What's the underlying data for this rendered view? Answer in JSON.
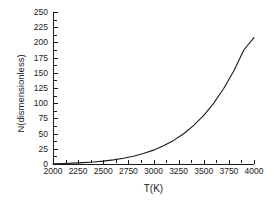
{
  "chart_data": {
    "type": "line",
    "title": "",
    "xlabel": "T(K)",
    "ylabel": "N(dismensionless)",
    "xlim": [
      2000,
      4000
    ],
    "ylim": [
      0,
      250
    ],
    "grid": false,
    "legend": "none",
    "xticks": [
      2000,
      2250,
      2500,
      2750,
      3000,
      3250,
      3500,
      3750,
      4000
    ],
    "xtick_labels": [
      "2000",
      "2250",
      "2500",
      "2750",
      "3000",
      "3250",
      "3500",
      "3750",
      "4000"
    ],
    "yticks": [
      0,
      25,
      50,
      75,
      100,
      125,
      150,
      175,
      200,
      225,
      250
    ],
    "ytick_labels": [
      "0",
      "25",
      "50",
      "75",
      "100",
      "125",
      "150",
      "175",
      "200",
      "225",
      "250"
    ],
    "x_minor_step": 125,
    "y_minor_step": 12.5,
    "series": [
      {
        "name": "N",
        "color": "#1a1a1a",
        "linewidth": 1.1,
        "x": [
          2000,
          2100,
          2200,
          2300,
          2400,
          2500,
          2600,
          2700,
          2800,
          2900,
          3000,
          3100,
          3200,
          3300,
          3400,
          3500,
          3600,
          3700,
          3800,
          3900,
          4000
        ],
        "y": [
          0.4,
          0.8,
          1.4,
          2.2,
          3.3,
          4.8,
          6.8,
          9.4,
          12.8,
          17.2,
          22.8,
          29.9,
          38.8,
          49.8,
          63.4,
          80.0,
          100.2,
          124.5,
          153.5,
          187.9,
          208.0
        ]
      }
    ]
  }
}
